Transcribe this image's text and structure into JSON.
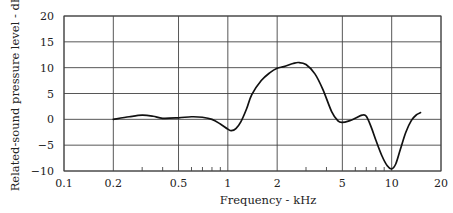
{
  "chart_data": {
    "type": "line",
    "title": "",
    "xlabel": "Frequency - kHz",
    "ylabel": "Related-sound pressure level - dB",
    "xscale": "log",
    "xlim": [
      0.1,
      20
    ],
    "ylim": [
      -10,
      20
    ],
    "x_ticks": [
      0.1,
      0.2,
      0.5,
      1,
      2,
      5,
      10,
      20
    ],
    "x_tick_labels": [
      "0.1",
      "0.2",
      "0.5",
      "1",
      "2",
      "5",
      "10",
      "20"
    ],
    "x_minor_ticks": [
      0.3,
      0.4,
      0.6,
      0.7,
      0.8,
      0.9,
      3,
      4,
      6,
      7,
      8,
      9
    ],
    "y_ticks": [
      -10,
      -5,
      0,
      5,
      10,
      15,
      20
    ],
    "y_tick_labels": [
      "−10",
      "−5",
      "0",
      "5",
      "10",
      "15",
      "20"
    ],
    "grid": true,
    "legend": null,
    "series": [
      {
        "name": "Response",
        "x": [
          0.2,
          0.25,
          0.3,
          0.35,
          0.4,
          0.5,
          0.6,
          0.7,
          0.8,
          0.9,
          1.0,
          1.05,
          1.12,
          1.2,
          1.3,
          1.4,
          1.6,
          1.8,
          2.0,
          2.2,
          2.5,
          2.7,
          3.0,
          3.4,
          3.8,
          4.3,
          4.7,
          5.0,
          5.5,
          6.0,
          6.6,
          7.0,
          7.5,
          8.0,
          8.7,
          9.4,
          10.0,
          10.6,
          11.3,
          12.2,
          13.2,
          14.2,
          15.0
        ],
        "values": [
          0.0,
          0.5,
          0.8,
          0.6,
          0.2,
          0.3,
          0.5,
          0.4,
          0.0,
          -0.9,
          -1.9,
          -2.2,
          -1.8,
          -0.5,
          2.0,
          4.8,
          7.5,
          9.0,
          9.9,
          10.2,
          10.8,
          11.0,
          10.6,
          8.8,
          5.8,
          1.5,
          -0.3,
          -0.6,
          -0.3,
          0.2,
          0.8,
          0.6,
          -1.5,
          -4.0,
          -7.0,
          -9.0,
          -9.6,
          -8.6,
          -5.8,
          -2.5,
          -0.2,
          0.9,
          1.3
        ]
      }
    ]
  },
  "colors": {
    "curve": "#111111",
    "grid": "#444444",
    "background": "#ffffff"
  }
}
